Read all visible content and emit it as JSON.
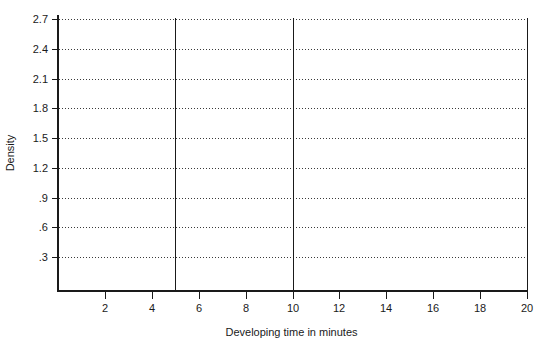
{
  "figure": {
    "background": "#ffffff",
    "axis_color": "#1a1a1a",
    "grid_color": "#3a3a3a",
    "text_color": "#1a1a1a"
  },
  "chart_data": {
    "type": "line",
    "title": "",
    "xlabel": "Developing time in minutes",
    "ylabel": "Density",
    "x_ticks": [
      2,
      4,
      6,
      8,
      10,
      12,
      14,
      16,
      18,
      20
    ],
    "y_ticks": [
      0.3,
      0.6,
      0.9,
      1.2,
      1.5,
      1.8,
      2.1,
      2.4,
      2.7
    ],
    "y_tick_labels": [
      ".3",
      ".6",
      ".9",
      "1.2",
      "1.5",
      "1.8",
      "2.1",
      "2.4",
      "2.7"
    ],
    "xlim": [
      0,
      20
    ],
    "ylim": [
      -0.03,
      2.74
    ],
    "grid": "horizontal-dotted",
    "legend": "none",
    "vertical_reference_lines_x": [
      5,
      10,
      20
    ],
    "series": []
  }
}
